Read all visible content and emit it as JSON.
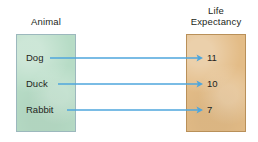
{
  "diagram": {
    "type": "mapping-diagram",
    "background_color": "#ffffff",
    "left_column": {
      "heading": "Animal",
      "box_color": "#b7dcc6",
      "border_color": "#9cb8bd",
      "items": [
        {
          "label": "Dog",
          "y": 58
        },
        {
          "label": "Duck",
          "y": 84
        },
        {
          "label": "Rabbit",
          "y": 110
        }
      ]
    },
    "right_column": {
      "heading": "Life\nExpectancy",
      "box_color": "#e3bc87",
      "border_color": "#b99059",
      "items": [
        {
          "label": "11",
          "y": 58
        },
        {
          "label": "10",
          "y": 84
        },
        {
          "label": "7",
          "y": 110
        }
      ]
    },
    "arrow_color": "#4ea6dc",
    "mappings": [
      {
        "from": "Dog",
        "to": "11",
        "from_x": 50,
        "to_x": 203,
        "y": 58
      },
      {
        "from": "Duck",
        "to": "10",
        "from_x": 58,
        "to_x": 203,
        "y": 84
      },
      {
        "from": "Rabbit",
        "to": "7",
        "from_x": 67,
        "to_x": 203,
        "y": 110
      }
    ]
  }
}
